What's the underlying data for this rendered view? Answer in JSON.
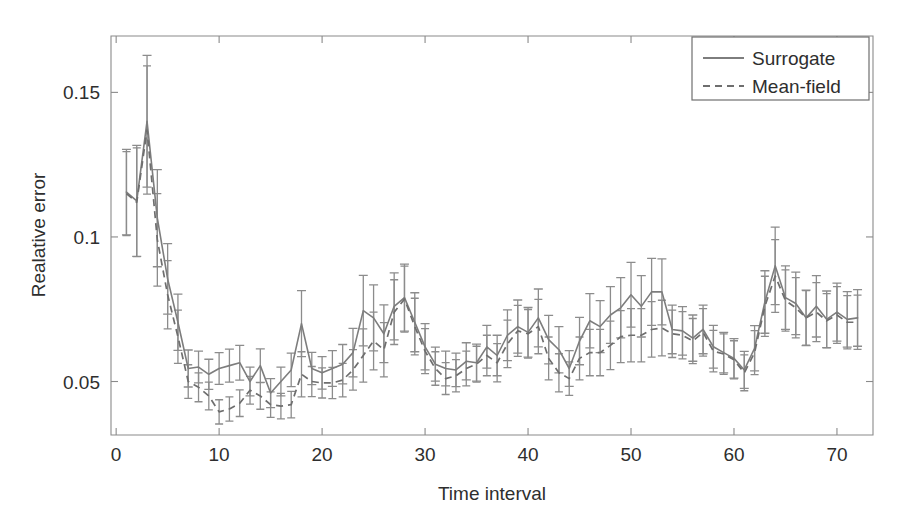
{
  "chart_data": {
    "type": "line",
    "title": "",
    "xlabel": "Time interval",
    "ylabel": "Realative error",
    "xlim": [
      -0.5,
      73.5
    ],
    "ylim": [
      0.0315,
      0.1695
    ],
    "xticks": [
      0,
      10,
      20,
      30,
      40,
      50,
      60,
      70
    ],
    "xticklabels": [
      "0",
      "10",
      "20",
      "30",
      "40",
      "50",
      "60",
      "70"
    ],
    "yticks": [
      0.05,
      0.1,
      0.15
    ],
    "yticklabels": [
      "0.05",
      "0.1",
      "0.15"
    ],
    "grid": false,
    "box": true,
    "legend_position": "top-right",
    "errorbars": true,
    "x": [
      1,
      2,
      3,
      4,
      5,
      6,
      7,
      8,
      9,
      10,
      11,
      12,
      13,
      14,
      15,
      16,
      17,
      18,
      19,
      20,
      21,
      22,
      23,
      24,
      25,
      26,
      27,
      28,
      29,
      30,
      31,
      32,
      33,
      34,
      35,
      36,
      37,
      38,
      39,
      40,
      41,
      42,
      43,
      44,
      45,
      46,
      47,
      48,
      49,
      50,
      51,
      52,
      53,
      54,
      55,
      56,
      57,
      58,
      59,
      60,
      61,
      62,
      63,
      64,
      65,
      66,
      67,
      68,
      69,
      70,
      71,
      72
    ],
    "series": [
      {
        "name": "Surrogate",
        "style": "solid",
        "color": "#7d7d7d",
        "values": [
          0.1155,
          0.1125,
          0.14,
          0.1065,
          0.0855,
          0.0705,
          0.0545,
          0.055,
          0.0525,
          0.0545,
          0.0555,
          0.0565,
          0.05,
          0.0555,
          0.046,
          0.05,
          0.054,
          0.07,
          0.0545,
          0.053,
          0.0545,
          0.056,
          0.06,
          0.0745,
          0.072,
          0.0665,
          0.076,
          0.079,
          0.0705,
          0.062,
          0.056,
          0.0545,
          0.054,
          0.057,
          0.0565,
          0.062,
          0.059,
          0.066,
          0.069,
          0.067,
          0.072,
          0.0645,
          0.061,
          0.0545,
          0.064,
          0.071,
          0.069,
          0.073,
          0.0755,
          0.08,
          0.076,
          0.081,
          0.081,
          0.068,
          0.0675,
          0.065,
          0.068,
          0.062,
          0.06,
          0.058,
          0.054,
          0.0615,
          0.0775,
          0.09,
          0.079,
          0.077,
          0.072,
          0.076,
          0.0715,
          0.074,
          0.0715,
          0.072
        ],
        "errors": [
          0.0148,
          0.0192,
          0.0228,
          0.0168,
          0.0122,
          0.0097,
          0.0064,
          0.0055,
          0.0052,
          0.0055,
          0.0057,
          0.006,
          0.005,
          0.0058,
          0.005,
          0.005,
          0.0058,
          0.0114,
          0.0056,
          0.0056,
          0.0062,
          0.0068,
          0.0084,
          0.0122,
          0.0114,
          0.01,
          0.0116,
          0.0116,
          0.0102,
          0.008,
          0.0059,
          0.006,
          0.0058,
          0.0064,
          0.0064,
          0.0074,
          0.007,
          0.0088,
          0.0092,
          0.0086,
          0.01,
          0.0084,
          0.008,
          0.0062,
          0.0082,
          0.0094,
          0.009,
          0.0098,
          0.0104,
          0.0112,
          0.0106,
          0.0116,
          0.0114,
          0.0084,
          0.0084,
          0.008,
          0.0084,
          0.0074,
          0.007,
          0.0068,
          0.0064,
          0.0078,
          0.0108,
          0.0134,
          0.011,
          0.0108,
          0.0096,
          0.0106,
          0.0098,
          0.01,
          0.0096,
          0.0098
        ]
      },
      {
        "name": "Mean-field",
        "style": "dashed",
        "color": "#6e6e6e",
        "values": [
          0.115,
          0.112,
          0.137,
          0.099,
          0.08,
          0.0655,
          0.05,
          0.048,
          0.045,
          0.0395,
          0.0405,
          0.0425,
          0.047,
          0.045,
          0.042,
          0.0415,
          0.042,
          0.0525,
          0.05,
          0.0495,
          0.0495,
          0.0505,
          0.054,
          0.059,
          0.064,
          0.061,
          0.074,
          0.0785,
          0.069,
          0.0605,
          0.0545,
          0.051,
          0.052,
          0.0545,
          0.056,
          0.059,
          0.0565,
          0.063,
          0.0675,
          0.0665,
          0.069,
          0.058,
          0.053,
          0.051,
          0.058,
          0.06,
          0.06,
          0.0625,
          0.0655,
          0.066,
          0.066,
          0.068,
          0.0685,
          0.0665,
          0.066,
          0.064,
          0.067,
          0.0605,
          0.0595,
          0.0575,
          0.053,
          0.06,
          0.076,
          0.0865,
          0.078,
          0.0755,
          0.072,
          0.074,
          0.071,
          0.073,
          0.0705,
          0.0705
        ],
        "errors": [
          0.0145,
          0.0188,
          0.0222,
          0.016,
          0.0118,
          0.0092,
          0.0058,
          0.005,
          0.0048,
          0.0042,
          0.0042,
          0.0046,
          0.0048,
          0.0046,
          0.0044,
          0.0044,
          0.0046,
          0.0078,
          0.0052,
          0.0052,
          0.0054,
          0.0058,
          0.007,
          0.0092,
          0.01,
          0.0094,
          0.0112,
          0.0114,
          0.0098,
          0.0078,
          0.0058,
          0.0055,
          0.0056,
          0.006,
          0.0062,
          0.007,
          0.0066,
          0.0082,
          0.0088,
          0.0084,
          0.0094,
          0.0074,
          0.0066,
          0.0058,
          0.0074,
          0.008,
          0.008,
          0.0084,
          0.009,
          0.0092,
          0.0092,
          0.0096,
          0.0096,
          0.0082,
          0.0082,
          0.0078,
          0.0082,
          0.0072,
          0.007,
          0.0066,
          0.0062,
          0.0076,
          0.0104,
          0.0126,
          0.0106,
          0.0104,
          0.0094,
          0.0102,
          0.0094,
          0.0098,
          0.0092,
          0.0094
        ]
      }
    ]
  },
  "legend": {
    "entries": [
      {
        "label": "Surrogate",
        "style": "solid"
      },
      {
        "label": "Mean-field",
        "style": "dashed"
      }
    ]
  },
  "axes": {
    "xlabel": "Time interval",
    "ylabel": "Realative error"
  },
  "colors": {
    "background": "#ffffff",
    "axis": "#8a8a8a",
    "surrogate": "#7d7d7d",
    "meanfield": "#6e6e6e",
    "errorbar": "#8c8c8c",
    "text": "#2e2e2e"
  }
}
